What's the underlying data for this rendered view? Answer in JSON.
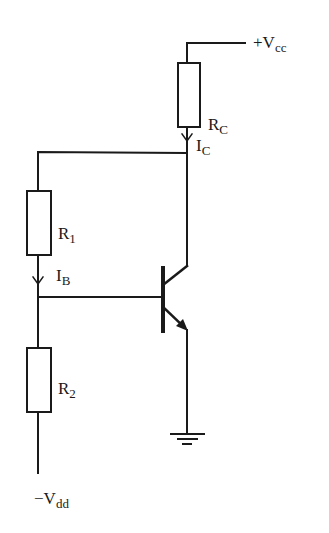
{
  "diagram": {
    "type": "transistor bias circuit",
    "labels": {
      "vcc": {
        "main": "+V",
        "sub": "cc"
      },
      "vdd": {
        "main": "−V",
        "sub": "dd"
      },
      "rc": {
        "main": "R",
        "sub": "C"
      },
      "ic": {
        "main": "I",
        "sub": "C"
      },
      "r1": {
        "main": "R",
        "sub": "1"
      },
      "ib": {
        "main": "I",
        "sub": "B"
      },
      "r2": {
        "main": "R",
        "sub": "2"
      }
    },
    "components": [
      {
        "id": "RC",
        "kind": "resistor",
        "label": "RC"
      },
      {
        "id": "R1",
        "kind": "resistor",
        "label": "R1"
      },
      {
        "id": "R2",
        "kind": "resistor",
        "label": "R2"
      },
      {
        "id": "Q1",
        "kind": "NPN transistor"
      },
      {
        "id": "GND",
        "kind": "ground"
      }
    ],
    "currents": [
      {
        "label": "IC",
        "direction": "down"
      },
      {
        "label": "IB",
        "direction": "down"
      }
    ]
  }
}
